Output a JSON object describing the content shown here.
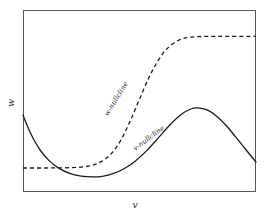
{
  "figure": {
    "name": "phase-plane-nullclines",
    "background_color": "#ffffff",
    "frame_color": "#555555"
  },
  "axes": {
    "x_label": "v",
    "y_label": "w",
    "x_label_name": "v-axis-label",
    "y_label_name": "w-axis-label",
    "frame": {
      "left": 23,
      "top": 10,
      "right": 256,
      "bottom": 192
    }
  },
  "annotations": [
    {
      "text": "w-nullcline",
      "rotation": -58,
      "x": 118,
      "y": 100,
      "style": "dashed-curve-label"
    },
    {
      "text": "v-nullcline",
      "rotation": -37,
      "x": 150,
      "y": 140,
      "style": "solid-curve-label"
    }
  ],
  "chart_data": {
    "type": "line",
    "title": "",
    "xlabel": "v",
    "ylabel": "w",
    "grid": false,
    "legend": "none",
    "xlim": [
      0,
      1
    ],
    "ylim": [
      0,
      1
    ],
    "axis_ticks": {
      "x": [],
      "y": []
    },
    "series": [
      {
        "name": "v-nullcline",
        "style": "solid",
        "color": "#1a1a1a",
        "description": "cubic-like curve: starts high at left edge, decreases steeply to a local minimum, rises to a local maximum near right-of-center, then falls toward the right edge",
        "points": [
          [
            0.0,
            0.423
          ],
          [
            0.02,
            0.358
          ],
          [
            0.045,
            0.291
          ],
          [
            0.075,
            0.228
          ],
          [
            0.11,
            0.175
          ],
          [
            0.15,
            0.134
          ],
          [
            0.2,
            0.102
          ],
          [
            0.25,
            0.087
          ],
          [
            0.3,
            0.083
          ],
          [
            0.34,
            0.086
          ],
          [
            0.38,
            0.098
          ],
          [
            0.43,
            0.125
          ],
          [
            0.48,
            0.168
          ],
          [
            0.53,
            0.226
          ],
          [
            0.58,
            0.296
          ],
          [
            0.63,
            0.368
          ],
          [
            0.68,
            0.427
          ],
          [
            0.72,
            0.456
          ],
          [
            0.75,
            0.462
          ],
          [
            0.79,
            0.451
          ],
          [
            0.83,
            0.418
          ],
          [
            0.87,
            0.368
          ],
          [
            0.91,
            0.307
          ],
          [
            0.95,
            0.243
          ],
          [
            1.0,
            0.165
          ]
        ]
      },
      {
        "name": "w-nullcline",
        "style": "dashed",
        "color": "#1a1a1a",
        "description": "sigmoid: flat low plateau on the left, steep rise through the middle, flat high plateau on the right",
        "points": [
          [
            0.0,
            0.132
          ],
          [
            0.1,
            0.132
          ],
          [
            0.18,
            0.133
          ],
          [
            0.25,
            0.137
          ],
          [
            0.3,
            0.148
          ],
          [
            0.34,
            0.17
          ],
          [
            0.38,
            0.212
          ],
          [
            0.42,
            0.285
          ],
          [
            0.46,
            0.39
          ],
          [
            0.5,
            0.51
          ],
          [
            0.54,
            0.628
          ],
          [
            0.58,
            0.722
          ],
          [
            0.62,
            0.79
          ],
          [
            0.67,
            0.835
          ],
          [
            0.72,
            0.851
          ],
          [
            0.79,
            0.855
          ],
          [
            0.88,
            0.855
          ],
          [
            1.0,
            0.855
          ]
        ]
      }
    ]
  }
}
